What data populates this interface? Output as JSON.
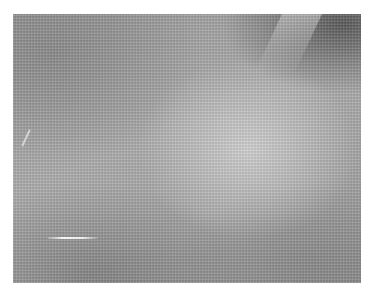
{
  "image": {
    "subject": "gray woven fabric texture photograph",
    "colors": {
      "background": "#ffffff",
      "base_gray": "#a3a3a3",
      "highlight_gray": "#d7d7d7",
      "dark_corner": "#3c3c3c"
    }
  }
}
